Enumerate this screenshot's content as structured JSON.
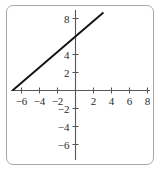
{
  "chart_data": {
    "type": "line",
    "title": "",
    "xlabel": "",
    "ylabel": "",
    "xlim": [
      -7.6,
      9.2
    ],
    "ylim": [
      -7.4,
      9.3
    ],
    "grid": false,
    "legend": null,
    "axis_color": "#55555a",
    "line_color": "#111111",
    "frame_color": "#a8a8a8",
    "background": "#ffffff",
    "xticks": [
      -6,
      -4,
      -2,
      2,
      4,
      6,
      8
    ],
    "yticks": [
      -6,
      -4,
      -2,
      2,
      4,
      8
    ],
    "xtick_labels": [
      "−6",
      "−4",
      "−2",
      "2",
      "4",
      "6",
      "8"
    ],
    "ytick_labels": [
      "−6",
      "−4",
      "−2",
      "2",
      "4",
      "8"
    ],
    "series": [
      {
        "name": "line",
        "slope": 0.857,
        "intercept": 6,
        "x": [
          -7,
          3.1
        ],
        "y": [
          0,
          8.66
        ]
      }
    ]
  }
}
